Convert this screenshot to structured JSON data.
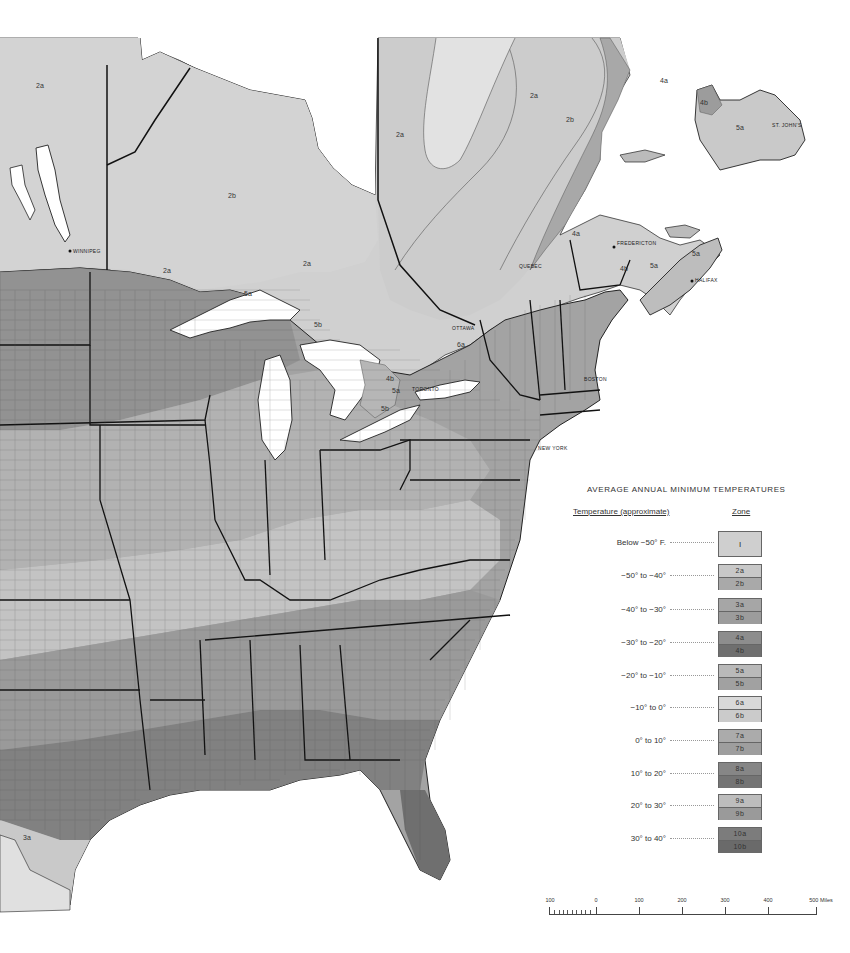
{
  "map": {
    "region": "Eastern United States and Southeastern Canada",
    "zone_labels": [
      {
        "text": "2a",
        "x": 36,
        "y": 88
      },
      {
        "text": "2b",
        "x": 228,
        "y": 198
      },
      {
        "text": "2a",
        "x": 530,
        "y": 98
      },
      {
        "text": "2b",
        "x": 566,
        "y": 122
      },
      {
        "text": "2a",
        "x": 396,
        "y": 137
      },
      {
        "text": "4a",
        "x": 660,
        "y": 83
      },
      {
        "text": "4b",
        "x": 700,
        "y": 105
      },
      {
        "text": "5a",
        "x": 736,
        "y": 130
      },
      {
        "text": "2a",
        "x": 163,
        "y": 273
      },
      {
        "text": "2a",
        "x": 303,
        "y": 266
      },
      {
        "text": "5a",
        "x": 244,
        "y": 296
      },
      {
        "text": "5b",
        "x": 314,
        "y": 327
      },
      {
        "text": "4a",
        "x": 572,
        "y": 236
      },
      {
        "text": "4b",
        "x": 620,
        "y": 271
      },
      {
        "text": "5a",
        "x": 650,
        "y": 268
      },
      {
        "text": "5a",
        "x": 692,
        "y": 256
      },
      {
        "text": "4b",
        "x": 386,
        "y": 381
      },
      {
        "text": "5a",
        "x": 392,
        "y": 393
      },
      {
        "text": "5b",
        "x": 381,
        "y": 411
      },
      {
        "text": "6a",
        "x": 457,
        "y": 347
      },
      {
        "text": "3a",
        "x": 23,
        "y": 840
      }
    ],
    "city_labels": [
      {
        "text": "WINNIPEG",
        "x": 73,
        "y": 253
      },
      {
        "text": "QUEBEC",
        "x": 519,
        "y": 268
      },
      {
        "text": "FREDERICTON",
        "x": 617,
        "y": 245
      },
      {
        "text": "HALIFAX",
        "x": 695,
        "y": 282
      },
      {
        "text": "ST. JOHN'S",
        "x": 772,
        "y": 127
      },
      {
        "text": "OTTAWA",
        "x": 452,
        "y": 330
      },
      {
        "text": "TORONTO",
        "x": 412,
        "y": 391
      },
      {
        "text": "BOSTON",
        "x": 584,
        "y": 381
      },
      {
        "text": "NEW YORK",
        "x": 538,
        "y": 450
      }
    ]
  },
  "legend": {
    "title": "AVERAGE ANNUAL MINIMUM TEMPERATURES",
    "header_temperature": "Temperature (approximate)",
    "header_zone": "Zone",
    "rows": [
      {
        "temp": "Below −50° F.",
        "zone_single": "I",
        "color": "#cfcfcf"
      },
      {
        "temp": "−50° to −40°",
        "zone_a": "2a",
        "zone_b": "2b",
        "color_a": "#c8c8c8",
        "color_b": "#a9a9a9"
      },
      {
        "temp": "−40° to −30°",
        "zone_a": "3a",
        "zone_b": "3b",
        "color_a": "#a6a6a6",
        "color_b": "#9c9c9c"
      },
      {
        "temp": "−30° to −20°",
        "zone_a": "4a",
        "zone_b": "4b",
        "color_a": "#8d8d8d",
        "color_b": "#6f6f6f"
      },
      {
        "temp": "−20° to −10°",
        "zone_a": "5a",
        "zone_b": "5b",
        "color_a": "#b9b9b9",
        "color_b": "#a1a1a1"
      },
      {
        "temp": "−10° to   0°",
        "zone_a": "6a",
        "zone_b": "6b",
        "color_a": "#d9d9d9",
        "color_b": "#cbcbcb"
      },
      {
        "temp": "0° to  10°",
        "zone_a": "7a",
        "zone_b": "7b",
        "color_a": "#ababab",
        "color_b": "#9e9e9e"
      },
      {
        "temp": "10° to  20°",
        "zone_a": "8a",
        "zone_b": "8b",
        "color_a": "#868686",
        "color_b": "#747474"
      },
      {
        "temp": "20° to  30°",
        "zone_a": "9a",
        "zone_b": "9b",
        "color_a": "#bdbdbd",
        "color_b": "#9a9a9a"
      },
      {
        "temp": "30° to  40°",
        "zone_a": "10a",
        "zone_b": "10b",
        "color_a": "#7c7c7c",
        "color_b": "#6a6a6a"
      }
    ]
  },
  "scale": {
    "labels": [
      "100",
      "0",
      "100",
      "200",
      "300",
      "400",
      "500 Miles"
    ],
    "unit": "Miles"
  }
}
